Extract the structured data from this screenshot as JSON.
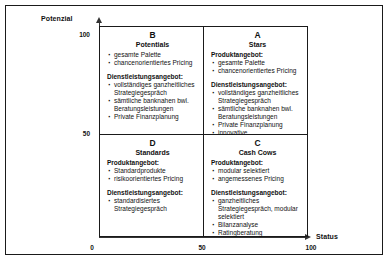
{
  "axes": {
    "y_title": "Potenzial",
    "x_title": "Status",
    "y_ticks": [
      "100",
      "50"
    ],
    "x_ticks": [
      "0",
      "50",
      "100"
    ]
  },
  "chart_data": {
    "type": "table",
    "xlabel": "Status",
    "ylabel": "Potenzial",
    "xlim": [
      0,
      100
    ],
    "ylim": [
      0,
      100
    ],
    "xticks": [
      0,
      50,
      100
    ],
    "yticks": [
      50,
      100
    ],
    "grid": false,
    "legend": "none",
    "quadrants": [
      {
        "id": "B",
        "letter": "B",
        "name": "Potentials",
        "x_range": [
          0,
          50
        ],
        "y_range": [
          50,
          100
        ],
        "groups": [
          {
            "heading": "",
            "items": [
              "gesamte Palette",
              "chancenorientiertes Pricing"
            ]
          },
          {
            "heading": "Dienstleistungsangebot:",
            "items": [
              "vollständiges ganzheitliches Strategiegespräch",
              "sämtliche banknahen bwl. Beratungsleistungen",
              "Private Finanzplanung"
            ]
          }
        ]
      },
      {
        "id": "A",
        "letter": "A",
        "name": "Stars",
        "x_range": [
          50,
          100
        ],
        "y_range": [
          50,
          100
        ],
        "groups": [
          {
            "heading": "Produktangebot:",
            "items": [
              "gesamte Palette",
              "chancenorientiertes Pricing"
            ]
          },
          {
            "heading": "Dienstleistungsangebot:",
            "items": [
              "vollständiges ganzheitliches Strategiegespräch",
              "sämtliche banknahen bwl. Beratungsleistungen",
              "Private Finanzplanung",
              "innovative Beratungsleistungen"
            ]
          }
        ]
      },
      {
        "id": "D",
        "letter": "D",
        "name": "Standards",
        "x_range": [
          0,
          50
        ],
        "y_range": [
          0,
          50
        ],
        "groups": [
          {
            "heading": "Produktangebot:",
            "items": [
              "Standardprodukte",
              "risikoorientiertes Pricing"
            ]
          },
          {
            "heading": "Dienstleistungsangebot:",
            "items": [
              "standardisiertes Strategiegespräch"
            ]
          }
        ]
      },
      {
        "id": "C",
        "letter": "C",
        "name": "Cash Cows",
        "x_range": [
          50,
          100
        ],
        "y_range": [
          0,
          50
        ],
        "groups": [
          {
            "heading": "Produktangebot:",
            "items": [
              "modular selektiert",
              "angemessenes Pricing"
            ]
          },
          {
            "heading": "Dienstleistungsangebot:",
            "items": [
              "ganzheitliches Strategiegespräch, modular selektiert",
              "Bilanzanalyse",
              "Ratingberatung"
            ]
          }
        ]
      }
    ]
  }
}
